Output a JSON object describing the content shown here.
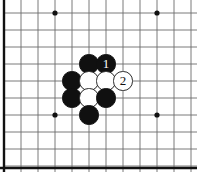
{
  "figure": {
    "kind": "go-board-diagram",
    "title": "",
    "width": 197,
    "height": 172,
    "background_color": "#ffffff"
  },
  "board": {
    "grid_line_color": "#6b6b6b",
    "border_color": "#111111",
    "border_edges": [
      "left",
      "bottom"
    ],
    "border_thickness": 2.4,
    "grid_thickness": 0.9,
    "spacing": 17,
    "origin_x": 4,
    "origin_y": 13,
    "columns": 12,
    "rows": 10,
    "vertical_lines_x": [
      4,
      21,
      38,
      55,
      72,
      89,
      106,
      123,
      140,
      157,
      174,
      191
    ],
    "horizontal_lines_y": [
      13,
      30,
      47,
      64,
      81,
      98,
      115,
      132,
      149,
      166
    ],
    "star_points": [
      {
        "name": "star-point-top-left",
        "x": 55,
        "y": 13
      },
      {
        "name": "star-point-top-right",
        "x": 157,
        "y": 13
      },
      {
        "name": "star-point-bottom-left",
        "x": 55,
        "y": 115
      },
      {
        "name": "star-point-bottom-right",
        "x": 157,
        "y": 115
      }
    ],
    "star_point_radius": 2.6,
    "star_point_color": "#111111"
  },
  "stones": {
    "radius": 9.6,
    "black_color": "#101010",
    "white_color": "#ffffff",
    "white_outline_color": "#2b2b2b",
    "items": [
      {
        "name": "black-stone-upper-left",
        "color": "black",
        "label": "",
        "x": 89,
        "y": 64
      },
      {
        "name": "black-stone-move-1",
        "color": "black",
        "label": "1",
        "x": 106,
        "y": 64
      },
      {
        "name": "black-stone-left-upper",
        "color": "black",
        "label": "",
        "x": 72,
        "y": 81
      },
      {
        "name": "white-stone-center-left",
        "color": "white",
        "label": "",
        "x": 89,
        "y": 81
      },
      {
        "name": "white-stone-center-right",
        "color": "white",
        "label": "",
        "x": 106,
        "y": 81
      },
      {
        "name": "white-stone-move-2",
        "color": "white",
        "label": "2",
        "x": 123,
        "y": 81
      },
      {
        "name": "black-stone-left-lower",
        "color": "black",
        "label": "",
        "x": 72,
        "y": 98
      },
      {
        "name": "white-stone-lower-center",
        "color": "white",
        "label": "",
        "x": 89,
        "y": 98
      },
      {
        "name": "black-stone-right-lower",
        "color": "black",
        "label": "",
        "x": 106,
        "y": 98
      },
      {
        "name": "black-stone-bottom",
        "color": "black",
        "label": "",
        "x": 89,
        "y": 115
      }
    ]
  }
}
